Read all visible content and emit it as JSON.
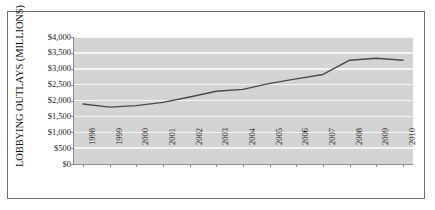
{
  "chart_data": {
    "type": "line",
    "title": "",
    "xlabel": "",
    "ylabel": "LOBBYING OUTLAYS (MILLIONS)",
    "categories": [
      "1998",
      "1999",
      "2000",
      "2001",
      "2002",
      "2003",
      "2004",
      "2005",
      "2006",
      "2007",
      "2008",
      "2009",
      "2010"
    ],
    "values": [
      1890,
      1790,
      1840,
      1940,
      2110,
      2290,
      2350,
      2540,
      2680,
      2820,
      3270,
      3330,
      3270
    ],
    "series": [
      {
        "name": "Lobbying Outlays",
        "values": [
          1890,
          1790,
          1840,
          1940,
          2110,
          2290,
          2350,
          2540,
          2680,
          2820,
          3270,
          3330,
          3270
        ]
      }
    ],
    "ylim": [
      0,
      4000
    ],
    "ytick_values": [
      0,
      500,
      1000,
      1500,
      2000,
      2500,
      3000,
      3500,
      4000
    ],
    "ytick_labels": [
      "$0",
      "$500",
      "$1,000",
      "$1,500",
      "$2,000",
      "$2,500",
      "$3,000",
      "$3,500",
      "$4,000"
    ],
    "grid": true,
    "legend": false,
    "legend_position": "none",
    "line_color": "#4a4a4a",
    "plot_background_color": "#d4d4d4",
    "gridline_color": "#f4f4f4",
    "axis_color": "#8a8a8a",
    "frame_color": "#6e6e6e"
  }
}
